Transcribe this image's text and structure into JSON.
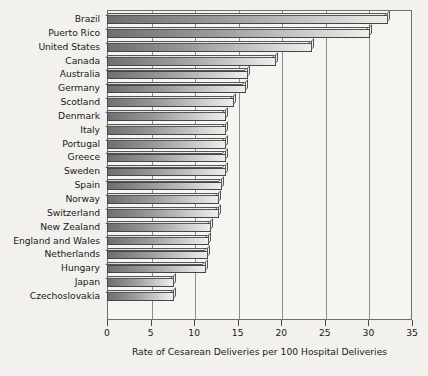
{
  "chart_data": {
    "type": "bar",
    "orientation": "horizontal",
    "title": "",
    "xlabel": "Rate of Cesarean Deliveries per 100 Hospital Deliveries",
    "ylabel": "",
    "xlim": [
      0,
      35
    ],
    "xticks": [
      0,
      5,
      10,
      15,
      20,
      25,
      30,
      35
    ],
    "grid": true,
    "grid_axis": "x",
    "legend": false,
    "categories": [
      "Brazil",
      "Puerto Rico",
      "United States",
      "Canada",
      "Australia",
      "Germany",
      "Scotland",
      "Denmark",
      "Italy",
      "Portugal",
      "Greece",
      "Sweden",
      "Spain",
      "Norway",
      "Switzerland",
      "New Zealand",
      "England and Wales",
      "Netherlands",
      "Hungary",
      "Japan",
      "Czechoslovakia"
    ],
    "values": [
      32.3,
      30.2,
      23.5,
      19.4,
      16.2,
      16.0,
      14.6,
      13.7,
      13.7,
      13.6,
      13.6,
      13.6,
      13.2,
      12.9,
      12.9,
      11.9,
      11.7,
      11.6,
      11.4,
      7.7,
      7.7
    ],
    "bar_style": "3d-isometric-grayscale",
    "colors": {
      "bar_dark": "#6f6f71",
      "bar_light": "#efeeeb",
      "bar_outline": "#46464a",
      "plot_background": "#f6f5f2",
      "figure_background": "#f2f1ee",
      "gridline": "#8d8d8f",
      "frame": "#6e6e70",
      "text": "#19191b"
    }
  }
}
